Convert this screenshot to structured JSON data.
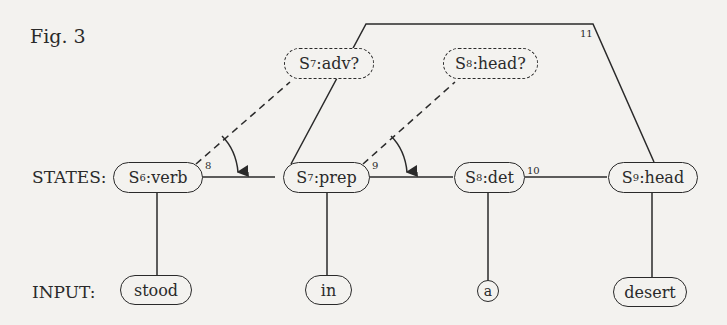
{
  "figure": {
    "title": "Fig. 3",
    "row_labels": {
      "states": "STATES:",
      "input": "INPUT:"
    }
  },
  "states": [
    {
      "id": "S",
      "sub": "6",
      "label": ":verb"
    },
    {
      "id": "S",
      "sub": "7",
      "label": ":prep"
    },
    {
      "id": "S",
      "sub": "8",
      "label": ":det"
    },
    {
      "id": "S",
      "sub": "9",
      "label": ":head"
    }
  ],
  "expectations": [
    {
      "id": "S",
      "sub": "7",
      "label": ":adv?"
    },
    {
      "id": "S",
      "sub": "8",
      "label": ":head?"
    }
  ],
  "inputs": [
    "stood",
    "in",
    "a",
    "desert"
  ],
  "edge_numbers": [
    "8",
    "9",
    "10",
    "11"
  ]
}
